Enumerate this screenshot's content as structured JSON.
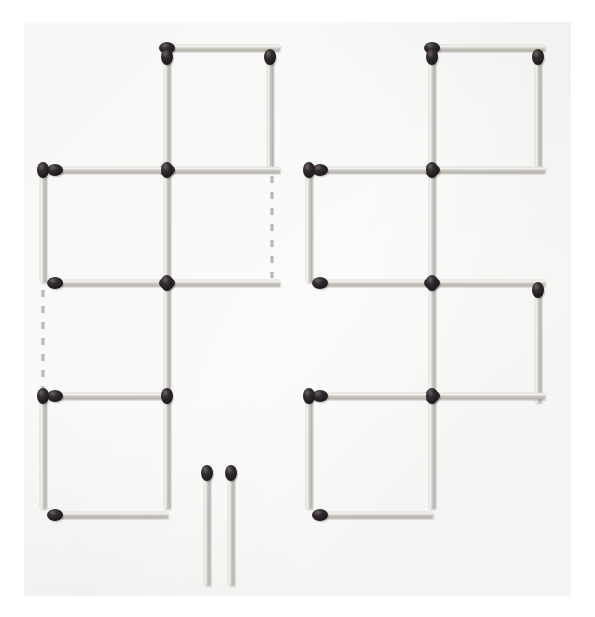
{
  "scene": {
    "title": "Matchstick puzzle figure",
    "description": "Two matchstick arrangements of three squares each, plus two loose matchsticks and two dashed guide lines",
    "canvas": {
      "width": 595,
      "height": 617
    },
    "background_color": "#ffffff",
    "paper": {
      "name": "paper-sheet",
      "x": 24,
      "y": 22,
      "width": 547,
      "height": 574,
      "color": "#f2f2f1"
    },
    "colors": {
      "stick_body": "#c9c7c0",
      "stick_body_light": "#e4e2dc",
      "stick_body_dark": "#a9a7a0",
      "stick_head": "#231f20",
      "stick_head_highlight": "#5a5457",
      "dashed_line": "#b9b7b2"
    },
    "geometry": {
      "stick_length": 113,
      "stick_thickness": 7,
      "head_radius_x": 6,
      "head_radius_y": 8
    }
  },
  "left_group": {
    "name": "left-matchstick-figure",
    "label": "Left arrangement: three squares in a staircase",
    "square_count": 3,
    "matches": [
      {
        "id": "L1",
        "name": "match-top-square-top",
        "orientation": "horizontal",
        "x1": 167,
        "y1": 48,
        "x2": 280,
        "y2": 48,
        "head_at": "start"
      },
      {
        "id": "L2",
        "name": "match-top-square-left",
        "orientation": "vertical",
        "x1": 167,
        "y1": 57,
        "x2": 167,
        "y2": 170,
        "head_at": "start"
      },
      {
        "id": "L3",
        "name": "match-top-square-right",
        "orientation": "vertical",
        "x1": 270,
        "y1": 57,
        "x2": 270,
        "y2": 170,
        "head_at": "start"
      },
      {
        "id": "L4",
        "name": "match-top-square-bottom",
        "orientation": "horizontal",
        "x1": 167,
        "y1": 170,
        "x2": 280,
        "y2": 170,
        "head_at": "start"
      },
      {
        "id": "L5",
        "name": "match-middle-square-top",
        "orientation": "horizontal",
        "x1": 55,
        "y1": 170,
        "x2": 168,
        "y2": 170,
        "head_at": "start"
      },
      {
        "id": "L6",
        "name": "match-middle-square-left",
        "orientation": "vertical",
        "x1": 43,
        "y1": 170,
        "x2": 43,
        "y2": 283,
        "head_at": "start"
      },
      {
        "id": "L7",
        "name": "match-middle-square-right",
        "orientation": "vertical",
        "x1": 167,
        "y1": 170,
        "x2": 167,
        "y2": 283,
        "head_at": "start"
      },
      {
        "id": "L8",
        "name": "match-middle-square-bottom",
        "orientation": "horizontal",
        "x1": 55,
        "y1": 283,
        "x2": 168,
        "y2": 283,
        "head_at": "start"
      },
      {
        "id": "L9",
        "name": "match-middle-row-right-extend",
        "orientation": "horizontal",
        "x1": 167,
        "y1": 283,
        "x2": 280,
        "y2": 283,
        "head_at": "start"
      },
      {
        "id": "L10",
        "name": "match-center-vertical-down",
        "orientation": "vertical",
        "x1": 167,
        "y1": 283,
        "x2": 167,
        "y2": 396,
        "head_at": "start"
      },
      {
        "id": "L11",
        "name": "match-bottom-square-top",
        "orientation": "horizontal",
        "x1": 55,
        "y1": 396,
        "x2": 168,
        "y2": 396,
        "head_at": "start"
      },
      {
        "id": "L12",
        "name": "match-bottom-square-left",
        "orientation": "vertical",
        "x1": 43,
        "y1": 396,
        "x2": 43,
        "y2": 509,
        "head_at": "start"
      },
      {
        "id": "L13",
        "name": "match-bottom-square-right",
        "orientation": "vertical",
        "x1": 167,
        "y1": 396,
        "x2": 167,
        "y2": 509,
        "head_at": "start"
      },
      {
        "id": "L14",
        "name": "match-bottom-square-bottom",
        "orientation": "horizontal",
        "x1": 55,
        "y1": 515,
        "x2": 168,
        "y2": 515,
        "head_at": "start"
      }
    ]
  },
  "right_group": {
    "name": "right-matchstick-figure",
    "label": "Right arrangement: three squares in a staircase with extra arm",
    "square_count": 3,
    "matches": [
      {
        "id": "R1",
        "name": "match-top-square-top",
        "orientation": "horizontal",
        "x1": 432,
        "y1": 48,
        "x2": 545,
        "y2": 48,
        "head_at": "start"
      },
      {
        "id": "R2",
        "name": "match-top-square-left",
        "orientation": "vertical",
        "x1": 432,
        "y1": 57,
        "x2": 432,
        "y2": 170,
        "head_at": "start"
      },
      {
        "id": "R3",
        "name": "match-top-square-right",
        "orientation": "vertical",
        "x1": 538,
        "y1": 57,
        "x2": 538,
        "y2": 170,
        "head_at": "start"
      },
      {
        "id": "R4",
        "name": "match-top-square-bottom",
        "orientation": "horizontal",
        "x1": 432,
        "y1": 170,
        "x2": 545,
        "y2": 170,
        "head_at": "start"
      },
      {
        "id": "R5",
        "name": "match-middle-left-square-top",
        "orientation": "horizontal",
        "x1": 320,
        "y1": 170,
        "x2": 433,
        "y2": 170,
        "head_at": "start"
      },
      {
        "id": "R6",
        "name": "match-middle-left-square-left",
        "orientation": "vertical",
        "x1": 309,
        "y1": 170,
        "x2": 309,
        "y2": 283,
        "head_at": "start"
      },
      {
        "id": "R7",
        "name": "match-center-vertical-upper",
        "orientation": "vertical",
        "x1": 432,
        "y1": 170,
        "x2": 432,
        "y2": 283,
        "head_at": "start"
      },
      {
        "id": "R8",
        "name": "match-middle-left-square-bottom",
        "orientation": "horizontal",
        "x1": 320,
        "y1": 283,
        "x2": 433,
        "y2": 283,
        "head_at": "start"
      },
      {
        "id": "R9",
        "name": "match-middle-right-square-top",
        "orientation": "horizontal",
        "x1": 432,
        "y1": 283,
        "x2": 545,
        "y2": 283,
        "head_at": "start"
      },
      {
        "id": "R10",
        "name": "match-middle-right-square-right",
        "orientation": "vertical",
        "x1": 538,
        "y1": 290,
        "x2": 538,
        "y2": 403,
        "head_at": "start"
      },
      {
        "id": "R11",
        "name": "match-center-vertical-lower",
        "orientation": "vertical",
        "x1": 432,
        "y1": 283,
        "x2": 432,
        "y2": 396,
        "head_at": "start"
      },
      {
        "id": "R12",
        "name": "match-middle-right-square-bottom",
        "orientation": "horizontal",
        "x1": 432,
        "y1": 396,
        "x2": 545,
        "y2": 396,
        "head_at": "start"
      },
      {
        "id": "R13",
        "name": "match-bottom-square-top",
        "orientation": "horizontal",
        "x1": 320,
        "y1": 396,
        "x2": 433,
        "y2": 396,
        "head_at": "start"
      },
      {
        "id": "R14",
        "name": "match-bottom-square-left",
        "orientation": "vertical",
        "x1": 309,
        "y1": 396,
        "x2": 309,
        "y2": 509,
        "head_at": "start"
      },
      {
        "id": "R15",
        "name": "match-bottom-square-right",
        "orientation": "vertical",
        "x1": 432,
        "y1": 396,
        "x2": 432,
        "y2": 509,
        "head_at": "start"
      },
      {
        "id": "R16",
        "name": "match-bottom-square-bottom",
        "orientation": "horizontal",
        "x1": 320,
        "y1": 515,
        "x2": 433,
        "y2": 515,
        "head_at": "start"
      }
    ]
  },
  "loose_matches": {
    "name": "loose-matchsticks",
    "label": "Two loose matchsticks",
    "count": 2,
    "matches": [
      {
        "id": "S1",
        "name": "loose-match-left",
        "orientation": "vertical",
        "x1": 207,
        "y1": 473,
        "x2": 207,
        "y2": 586,
        "head_at": "start"
      },
      {
        "id": "S2",
        "name": "loose-match-right",
        "orientation": "vertical",
        "x1": 231,
        "y1": 473,
        "x2": 231,
        "y2": 586,
        "head_at": "start"
      }
    ]
  },
  "dashed_lines": {
    "name": "dashed-guide-lines",
    "label": "Dashed guide lines showing removed matches",
    "count": 2,
    "lines": [
      {
        "id": "D1",
        "name": "dashed-line-left",
        "orientation": "vertical",
        "x1": 43,
        "y1": 290,
        "x2": 43,
        "y2": 392
      },
      {
        "id": "D2",
        "name": "dashed-line-right",
        "orientation": "vertical",
        "x1": 272,
        "y1": 176,
        "x2": 272,
        "y2": 278
      }
    ]
  }
}
